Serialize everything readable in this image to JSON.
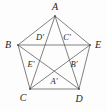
{
  "figure": {
    "name": "pentagon-with-inscribed-pentagram",
    "width": 107,
    "height": 111,
    "background_color": "#fdfdfd",
    "stroke_color": "#4a4a4a",
    "stroke_width": 0.7,
    "label_color": "#231f20",
    "outer_vertices": [
      {
        "id": "A",
        "label": "A",
        "x": 55,
        "y": 16,
        "label_x": 55,
        "label_y": 7
      },
      {
        "id": "B",
        "label": "B",
        "x": 18,
        "y": 45,
        "label_x": 8,
        "label_y": 45
      },
      {
        "id": "C",
        "label": "C",
        "x": 30,
        "y": 89,
        "label_x": 23,
        "label_y": 98
      },
      {
        "id": "D",
        "label": "D",
        "x": 79,
        "y": 89,
        "label_x": 79,
        "label_y": 99
      },
      {
        "id": "E",
        "label": "E",
        "x": 90,
        "y": 45,
        "label_x": 98,
        "label_y": 45
      }
    ],
    "inner_vertices": [
      {
        "id": "Dp",
        "label": "D′",
        "x": 44,
        "y": 42,
        "label_x": 40,
        "label_y": 37
      },
      {
        "id": "Cp",
        "label": "C′",
        "x": 66,
        "y": 42,
        "label_x": 67,
        "label_y": 37
      },
      {
        "id": "Ep",
        "label": "E′",
        "x": 37,
        "y": 64,
        "label_x": 31,
        "label_y": 64
      },
      {
        "id": "Bp",
        "label": "B′",
        "x": 73,
        "y": 64,
        "label_x": 74,
        "label_y": 64
      },
      {
        "id": "Ap",
        "label": "A′",
        "x": 55,
        "y": 77,
        "label_x": 54,
        "label_y": 81
      }
    ],
    "edges": [
      {
        "from": "A",
        "to": "B",
        "kind": "pentagon-side"
      },
      {
        "from": "B",
        "to": "C",
        "kind": "pentagon-side"
      },
      {
        "from": "C",
        "to": "D",
        "kind": "pentagon-side"
      },
      {
        "from": "D",
        "to": "E",
        "kind": "pentagon-side"
      },
      {
        "from": "E",
        "to": "A",
        "kind": "pentagon-side"
      },
      {
        "from": "A",
        "to": "C",
        "kind": "diagonal"
      },
      {
        "from": "A",
        "to": "D",
        "kind": "diagonal"
      },
      {
        "from": "B",
        "to": "D",
        "kind": "diagonal"
      },
      {
        "from": "B",
        "to": "E",
        "kind": "diagonal"
      },
      {
        "from": "C",
        "to": "E",
        "kind": "diagonal"
      }
    ]
  }
}
